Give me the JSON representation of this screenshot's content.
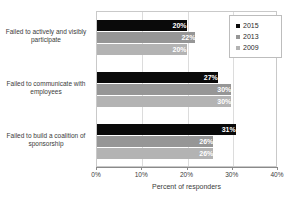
{
  "chart_data": {
    "type": "bar",
    "orientation": "horizontal",
    "title": "",
    "xlabel": "Percent of responders",
    "ylabel": "",
    "xlim": [
      0,
      40
    ],
    "xticks": [
      "0%",
      "10%",
      "20%",
      "30%",
      "40%"
    ],
    "grid": true,
    "legend_position": "top-right",
    "categories": [
      "Failed to actively and visibly participate",
      "Failed to communicate with employees",
      "Failed to build a coalition of sponsorship"
    ],
    "series": [
      {
        "name": "2015",
        "color": "#0a0a0a",
        "values": [
          20,
          27,
          31
        ],
        "labels": [
          "20%",
          "27%",
          "31%"
        ]
      },
      {
        "name": "2013",
        "color": "#969696",
        "values": [
          22,
          30,
          26
        ],
        "labels": [
          "22%",
          "30%",
          "26%"
        ]
      },
      {
        "name": "2009",
        "color": "#b3b3b3",
        "values": [
          20,
          30,
          26
        ],
        "labels": [
          "20%",
          "30%",
          "26%"
        ]
      }
    ]
  },
  "legend": {
    "items": [
      {
        "label": "2015"
      },
      {
        "label": "2013"
      },
      {
        "label": "2009"
      }
    ]
  },
  "axis": {
    "x_title": "Percent of responders",
    "ticks": [
      "0%",
      "10%",
      "20%",
      "30%",
      "40%"
    ]
  }
}
